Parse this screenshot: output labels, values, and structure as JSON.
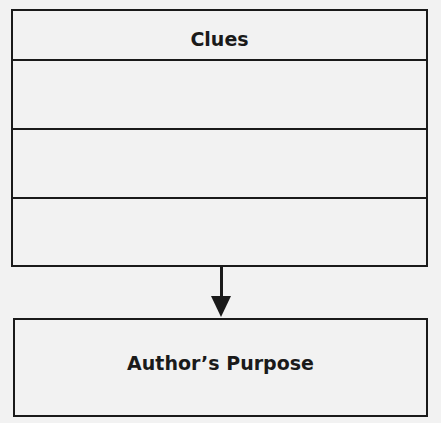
{
  "diagram": {
    "clues_box": {
      "title": "Clues",
      "rows": [
        "",
        "",
        ""
      ]
    },
    "arrow": {
      "direction": "down",
      "icon": "arrow-down-icon"
    },
    "purpose_box": {
      "title": "Author’s Purpose"
    },
    "colors": {
      "line": "#1a1a1a",
      "background": "#f2f2f2"
    }
  }
}
